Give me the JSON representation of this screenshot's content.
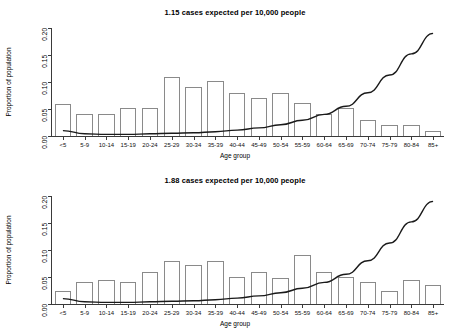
{
  "axis": {
    "ylabel": "Proportion of population",
    "xlabel": "Age group",
    "yticks": [
      "0.00",
      "0.05",
      "0.10",
      "0.15",
      "0.20"
    ],
    "ylim": [
      0,
      0.2
    ],
    "categories": [
      "<5",
      "5-9",
      "10-14",
      "15-19",
      "20-24",
      "25-29",
      "30-34",
      "35-39",
      "40-44",
      "45-49",
      "50-54",
      "55-59",
      "60-64",
      "65-69",
      "70-74",
      "75-79",
      "80-84",
      "85+"
    ]
  },
  "colors": {
    "bar_stroke": "#8a8a8a",
    "curve": "#1a1a1a",
    "axis": "#3a3a3a",
    "text": "#000000",
    "background": "#ffffff"
  },
  "panels": [
    {
      "title": "1.15  cases expected per 10,000 people",
      "rate": "1.15",
      "chart_data": {
        "type": "bar",
        "title": "1.15  cases expected per 10,000 people",
        "xlabel": "Age group",
        "ylabel": "Proportion of population",
        "ylim": [
          0,
          0.2
        ],
        "grid": false,
        "legend": "none",
        "categories": [
          "<5",
          "5-9",
          "10-14",
          "15-19",
          "20-24",
          "25-29",
          "30-34",
          "35-39",
          "40-44",
          "45-49",
          "50-54",
          "55-59",
          "60-64",
          "65-69",
          "70-74",
          "75-79",
          "80-84",
          "85+"
        ],
        "series": [
          {
            "name": "Proportion of population",
            "type": "bar",
            "values": [
              0.06,
              0.04,
              0.04,
              0.052,
              0.052,
              0.11,
              0.09,
              0.101,
              0.08,
              0.07,
              0.08,
              0.061,
              0.04,
              0.051,
              0.03,
              0.02,
              0.02,
              0.009
            ]
          },
          {
            "name": "Risk curve",
            "type": "line",
            "values": [
              0.01,
              0.004,
              0.003,
              0.003,
              0.004,
              0.005,
              0.006,
              0.008,
              0.011,
              0.015,
              0.021,
              0.029,
              0.04,
              0.055,
              0.08,
              0.113,
              0.152,
              0.19
            ]
          }
        ]
      }
    },
    {
      "title": "1.88  cases expected per 10,000 people",
      "rate": "1.88",
      "chart_data": {
        "type": "bar",
        "title": "1.88  cases expected per 10,000 people",
        "xlabel": "Age group",
        "ylabel": "Proportion of population",
        "ylim": [
          0,
          0.2
        ],
        "grid": false,
        "legend": "none",
        "categories": [
          "<5",
          "5-9",
          "10-14",
          "15-19",
          "20-24",
          "25-29",
          "30-34",
          "35-39",
          "40-44",
          "45-49",
          "50-54",
          "55-59",
          "60-64",
          "65-69",
          "70-74",
          "75-79",
          "80-84",
          "85+"
        ],
        "series": [
          {
            "name": "Proportion of population",
            "type": "bar",
            "values": [
              0.025,
              0.04,
              0.045,
              0.04,
              0.06,
              0.08,
              0.072,
              0.08,
              0.05,
              0.06,
              0.048,
              0.09,
              0.06,
              0.05,
              0.04,
              0.025,
              0.045,
              0.035
            ]
          },
          {
            "name": "Risk curve",
            "type": "line",
            "values": [
              0.01,
              0.004,
              0.003,
              0.003,
              0.004,
              0.005,
              0.006,
              0.008,
              0.011,
              0.015,
              0.021,
              0.029,
              0.04,
              0.055,
              0.08,
              0.113,
              0.152,
              0.19
            ]
          }
        ]
      }
    }
  ]
}
